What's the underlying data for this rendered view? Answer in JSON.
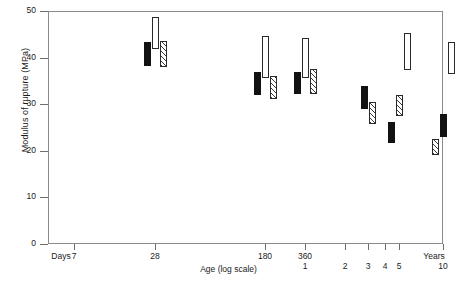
{
  "chart_data": {
    "type": "bar",
    "title": "",
    "xlabel": "Age (log scale)",
    "ylabel": "Modulus of rupture (MPa)",
    "ylim": [
      0,
      50
    ],
    "yticks": [
      0,
      10,
      20,
      30,
      40,
      50
    ],
    "ytick_labels": [
      "0",
      "10",
      "20",
      "30",
      "40",
      "50"
    ],
    "grid": false,
    "legend": "none",
    "x_axis_scale": "log",
    "x_unit_left_label": "Days",
    "x_unit_right_label": "Years",
    "xticks": [
      {
        "label": "7",
        "unit": "days",
        "x_px": 74
      },
      {
        "label": "28",
        "unit": "days",
        "x_px": 155
      },
      {
        "label": "180",
        "unit": "days",
        "x_px": 265
      },
      {
        "label": "360",
        "unit": "days",
        "x_px": 305
      },
      {
        "label": "1",
        "unit": "years",
        "x_px": 305
      },
      {
        "label": "2",
        "unit": "years",
        "x_px": 345
      },
      {
        "label": "3",
        "unit": "years",
        "x_px": 368
      },
      {
        "label": "4",
        "unit": "years",
        "x_px": 385
      },
      {
        "label": "5",
        "unit": "years",
        "x_px": 399
      },
      {
        "label": "10",
        "unit": "years",
        "x_px": 443
      }
    ],
    "series": [
      {
        "name": "solid-black",
        "fill": "solid"
      },
      {
        "name": "hatched",
        "fill": "hatch"
      },
      {
        "name": "open-white",
        "fill": "open"
      }
    ],
    "groups": [
      {
        "age": "28 days",
        "x_px": 155,
        "bars": [
          {
            "fill": "solid",
            "low": 38.2,
            "high": 43.3
          },
          {
            "fill": "open",
            "low": 41.8,
            "high": 48.8
          },
          {
            "fill": "hatch",
            "low": 38.0,
            "high": 43.6
          }
        ]
      },
      {
        "age": "180 days",
        "x_px": 265,
        "bars": [
          {
            "fill": "solid",
            "low": 32.0,
            "high": 37.0
          },
          {
            "fill": "open",
            "low": 35.6,
            "high": 44.6
          },
          {
            "fill": "hatch",
            "low": 31.2,
            "high": 36.1
          }
        ]
      },
      {
        "age": "360 days",
        "x_px": 305,
        "bars": [
          {
            "fill": "solid",
            "low": 32.2,
            "high": 37.0
          },
          {
            "fill": "open",
            "low": 35.6,
            "high": 44.2
          },
          {
            "fill": "hatch",
            "low": 32.2,
            "high": 37.6
          }
        ]
      },
      {
        "age": "3 years",
        "x_px": 368,
        "bars": [
          {
            "fill": "solid",
            "low": 29.0,
            "high": 33.8
          },
          {
            "fill": "hatch",
            "low": 25.7,
            "high": 30.4
          }
        ]
      },
      {
        "age": "5 years",
        "x_px": 399,
        "bars": [
          {
            "fill": "solid",
            "low": 21.6,
            "high": 26.2
          },
          {
            "fill": "hatch",
            "low": 27.4,
            "high": 32.0
          },
          {
            "fill": "open",
            "low": 37.4,
            "high": 45.2
          }
        ]
      },
      {
        "age": "10 years",
        "x_px": 443,
        "bars": [
          {
            "fill": "hatch",
            "low": 19.2,
            "high": 22.6
          },
          {
            "fill": "solid",
            "low": 23.0,
            "high": 28.0
          },
          {
            "fill": "open",
            "low": 36.4,
            "high": 43.4
          }
        ]
      }
    ]
  },
  "axes": {
    "ylabel": "Modulus of rupture (MPa)",
    "xlabel": "Age (log scale)",
    "days_label": "Days",
    "years_label": "Years"
  }
}
